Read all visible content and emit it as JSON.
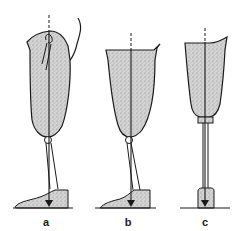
{
  "figure": {
    "panels": [
      {
        "id": "a",
        "label": "a",
        "description": "Above-knee prosthesis with knee joint and foot, load line anterior to knee"
      },
      {
        "id": "b",
        "label": "b",
        "description": "Prosthesis with knee joint, load line through knee"
      },
      {
        "id": "c",
        "label": "c",
        "description": "Below-knee prosthesis with pylon and adapter"
      }
    ],
    "colors": {
      "outline": "#1a1a1a",
      "stipple_fill": "#c8c8c8",
      "background": "#ffffff"
    }
  }
}
